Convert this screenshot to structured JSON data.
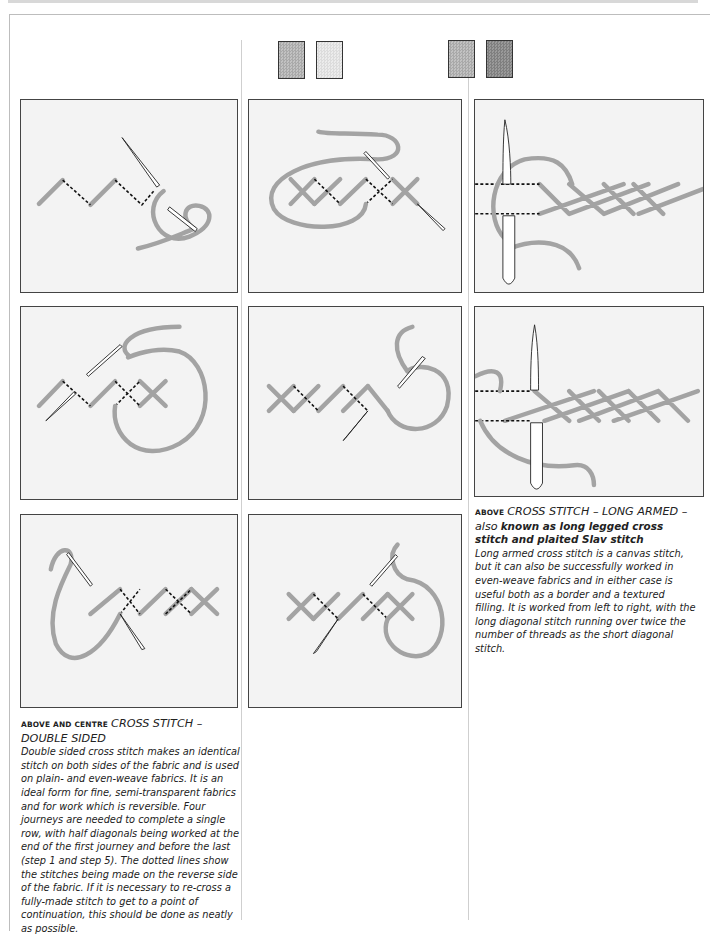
{
  "page": {
    "swatches": {
      "column2": [
        {
          "name": "mid-grey",
          "color": "#b5b5b5"
        },
        {
          "name": "light-grey",
          "color": "#e3e3e3"
        }
      ],
      "column3": [
        {
          "name": "mid-grey",
          "color": "#b5b5b5"
        },
        {
          "name": "dark-grey",
          "color": "#8c8c8c"
        }
      ]
    },
    "colors": {
      "thread": "#a3a3a3",
      "panel_background": "#f3f3f3",
      "panel_border": "#444444",
      "text": "#222222"
    }
  },
  "illustrations": {
    "double_sided": [
      {
        "step": 1,
        "description": "zigzag half diagonals with dotted reverse stitches, needle and looped thread"
      },
      {
        "step": 2,
        "description": "first crosses forming, thread looped around, needle entering"
      },
      {
        "step": 3,
        "description": "completed crosses with dotted reverse, needle at left"
      },
      {
        "step": 4,
        "description": "row of crosses with large thread loop and needle"
      },
      {
        "step": 5,
        "description": "crosses with dotted reverse stitches, needle and thread loop"
      },
      {
        "step": 6,
        "description": "crosses completed, needle pointing down-left, thread loop right"
      }
    ],
    "long_armed": [
      {
        "step": 1,
        "description": "long armed cross stitch row, needle vertical, dashed thread guides"
      },
      {
        "step": 2,
        "description": "plaited long armed stitch continued, needle vertical, thread loop left"
      }
    ]
  },
  "captions": {
    "double_sided": {
      "lead": "ABOVE AND CENTRE",
      "title": "CROSS STITCH – DOUBLE SIDED",
      "body": "Double sided cross stitch makes an identical stitch on both sides of the fabric and is used on plain- and even-weave fabrics. It is an ideal form for fine, semi-transparent fabrics and for work which is reversible. Four journeys are needed to complete a single row, with half diagonals being worked at the end of the first journey and before the last (step 1 and step 5). The dotted lines show the stitches being made on the reverse side of the fabric. If it is necessary to re-cross a fully-made stitch to get to a point of continuation, this should be done as neatly as possible."
    },
    "long_armed": {
      "lead": "ABOVE",
      "title": "CROSS STITCH – LONG ARMED – also",
      "subtitle": "known as long legged cross stitch and plaited Slav stitch",
      "body": "Long armed cross stitch is a canvas stitch, but it can also be successfully worked in even-weave fabrics and in either case is useful both as a border and a textured filling. It is worked from left to right, with the long diagonal stitch running over twice the number of threads as the short diagonal stitch."
    }
  }
}
